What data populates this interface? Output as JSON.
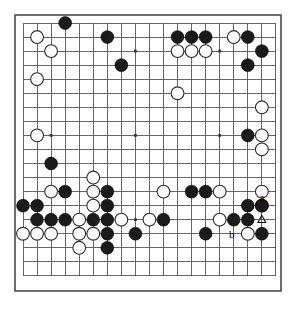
{
  "figure": {
    "name": "go-board-diagram",
    "board_size": 19,
    "background_color": "#ffffff",
    "line_color": "#555555",
    "border_color": "#4a4a4a",
    "black_color": "#1a1a1a",
    "white_color": "#fdfdfd"
  },
  "geometry": {
    "origin_x": 23,
    "origin_y": 23,
    "spacing": 14.05,
    "stone_radius": 6.4,
    "border_x": 15,
    "border_y": 15,
    "border_w": 266,
    "border_h": 276
  },
  "chart_data": {
    "type": "table",
    "columns": [
      "color",
      "col",
      "row"
    ],
    "star_points": [
      [
        3,
        3
      ],
      [
        9,
        3
      ],
      [
        15,
        3
      ],
      [
        3,
        9
      ],
      [
        9,
        9
      ],
      [
        15,
        9
      ],
      [
        3,
        15
      ],
      [
        9,
        15
      ],
      [
        15,
        15
      ]
    ],
    "black_stones": [
      [
        4,
        1
      ],
      [
        7,
        2
      ],
      [
        12,
        2
      ],
      [
        13,
        2
      ],
      [
        14,
        2
      ],
      [
        17,
        2
      ],
      [
        18,
        3
      ],
      [
        8,
        4
      ],
      [
        17,
        4
      ],
      [
        3,
        11
      ],
      [
        17,
        9
      ],
      [
        4,
        13
      ],
      [
        7,
        13
      ],
      [
        13,
        13
      ],
      [
        14,
        13
      ],
      [
        1,
        14
      ],
      [
        2,
        14
      ],
      [
        7,
        14
      ],
      [
        17,
        14
      ],
      [
        18,
        14
      ],
      [
        2,
        15
      ],
      [
        3,
        15
      ],
      [
        4,
        15
      ],
      [
        6,
        15
      ],
      [
        7,
        15
      ],
      [
        11,
        15
      ],
      [
        16,
        15
      ],
      [
        17,
        15
      ],
      [
        7,
        16
      ],
      [
        9,
        16
      ],
      [
        14,
        16
      ],
      [
        18,
        16
      ],
      [
        7,
        17
      ]
    ],
    "white_stones": [
      [
        2,
        2
      ],
      [
        16,
        2
      ],
      [
        3,
        3
      ],
      [
        12,
        3
      ],
      [
        13,
        3
      ],
      [
        14,
        3
      ],
      [
        2,
        5
      ],
      [
        12,
        6
      ],
      [
        18,
        7
      ],
      [
        2,
        9
      ],
      [
        18,
        9
      ],
      [
        18,
        10
      ],
      [
        6,
        12
      ],
      [
        3,
        13
      ],
      [
        6,
        13
      ],
      [
        11,
        13
      ],
      [
        15,
        13
      ],
      [
        18,
        13
      ],
      [
        6,
        14
      ],
      [
        18,
        14
      ],
      [
        5,
        15
      ],
      [
        8,
        15
      ],
      [
        10,
        15
      ],
      [
        15,
        15
      ],
      [
        1,
        16
      ],
      [
        2,
        16
      ],
      [
        3,
        16
      ],
      [
        5,
        16
      ],
      [
        6,
        16
      ],
      [
        17,
        16
      ],
      [
        5,
        17
      ]
    ],
    "marked_white_stones": [
      {
        "col": 18,
        "row": 15,
        "marker": "triangle"
      }
    ],
    "labels": [
      {
        "text": "a",
        "col": 18,
        "row": 14,
        "offset_x": 0,
        "offset_y": -7
      },
      {
        "text": "b",
        "col": 16,
        "row": 16,
        "offset_x": -2,
        "offset_y": 2
      }
    ]
  }
}
